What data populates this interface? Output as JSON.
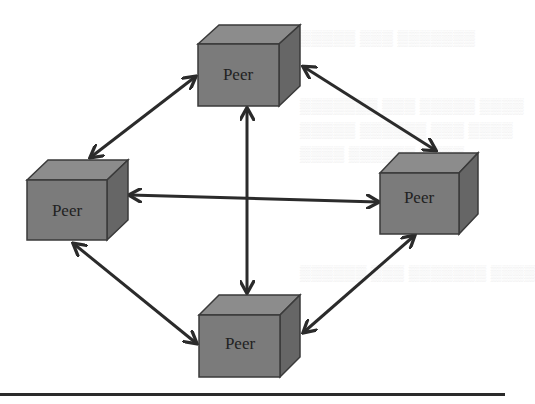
{
  "diagram": {
    "colors": {
      "background": "#ffffff",
      "cube_top": "#8c8c8c",
      "cube_front": "#7b7b7b",
      "cube_side": "#666666",
      "cube_outline": "#3a3a3a",
      "arrow": "#2b2b2b",
      "rule": "#2a2a2a"
    },
    "nodes": [
      {
        "id": "top",
        "label": "Peer",
        "front_x": 198,
        "front_y": 44,
        "w": 81,
        "h": 62,
        "depth": 20
      },
      {
        "id": "left",
        "label": "Peer",
        "front_x": 27,
        "front_y": 180,
        "w": 80,
        "h": 60,
        "depth": 20
      },
      {
        "id": "right",
        "label": "Peer",
        "front_x": 380,
        "front_y": 173,
        "w": 79,
        "h": 61,
        "depth": 19
      },
      {
        "id": "bottom",
        "label": "Peer",
        "front_x": 199,
        "front_y": 315,
        "w": 81,
        "h": 62,
        "depth": 20
      }
    ],
    "edges": [
      {
        "from": "top",
        "to": "left",
        "bidirectional": true
      },
      {
        "from": "top",
        "to": "right",
        "bidirectional": true
      },
      {
        "from": "top",
        "to": "bottom",
        "bidirectional": true
      },
      {
        "from": "left",
        "to": "right",
        "bidirectional": true
      },
      {
        "from": "left",
        "to": "bottom",
        "bidirectional": true
      },
      {
        "from": "right",
        "to": "bottom",
        "bidirectional": true
      }
    ]
  }
}
